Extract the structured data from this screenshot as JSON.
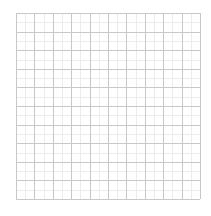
{
  "grid": {
    "rows": 10,
    "columns": 10,
    "line_color": "#c8c8c8",
    "minor_line_color": "#ececec",
    "background": "#ffffff"
  }
}
